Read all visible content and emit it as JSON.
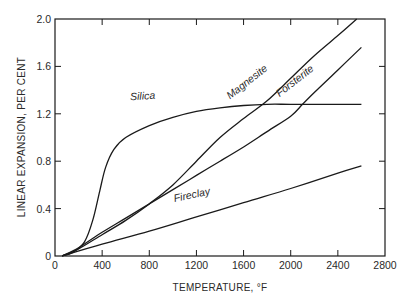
{
  "chart_data": {
    "type": "line",
    "title": "",
    "xlabel": "TEMPERATURE, °F",
    "ylabel": "LINEAR EXPANSION, PER CENT",
    "xlim": [
      0,
      2800
    ],
    "ylim": [
      0,
      2.0
    ],
    "x_ticks": [
      0,
      400,
      800,
      1200,
      1600,
      2000,
      2400,
      2800
    ],
    "x_tick_labels": [
      "0",
      "400",
      "800",
      "1200",
      "1600",
      "2000",
      "2400",
      "2800"
    ],
    "y_ticks": [
      0,
      0.4,
      0.8,
      1.2,
      1.6,
      2.0
    ],
    "y_tick_labels": [
      "0",
      "0.4",
      "0.8",
      "1.2",
      "1.6",
      "2.0"
    ],
    "grid": false,
    "legend": "inline labels on curves",
    "line_color": "#1a1a1a",
    "series": [
      {
        "name": "Silica",
        "label_pos": [
          640,
          1.29
        ],
        "label_angle": -3,
        "points": [
          [
            60,
            0
          ],
          [
            150,
            0.03
          ],
          [
            250,
            0.12
          ],
          [
            320,
            0.3
          ],
          [
            380,
            0.55
          ],
          [
            430,
            0.75
          ],
          [
            500,
            0.9
          ],
          [
            600,
            1.0
          ],
          [
            800,
            1.1
          ],
          [
            1000,
            1.17
          ],
          [
            1200,
            1.22
          ],
          [
            1400,
            1.25
          ],
          [
            1600,
            1.27
          ],
          [
            1800,
            1.28
          ],
          [
            2000,
            1.28
          ],
          [
            2300,
            1.28
          ],
          [
            2600,
            1.28
          ]
        ]
      },
      {
        "name": "Magnesite",
        "label_pos": [
          1500,
          1.3
        ],
        "label_angle": -38,
        "points": [
          [
            60,
            0
          ],
          [
            200,
            0.06
          ],
          [
            400,
            0.18
          ],
          [
            600,
            0.3
          ],
          [
            800,
            0.44
          ],
          [
            1000,
            0.6
          ],
          [
            1200,
            0.8
          ],
          [
            1400,
            1.0
          ],
          [
            1600,
            1.16
          ],
          [
            1800,
            1.31
          ],
          [
            2000,
            1.5
          ],
          [
            2200,
            1.69
          ],
          [
            2400,
            1.86
          ],
          [
            2560,
            2.0
          ]
        ]
      },
      {
        "name": "Forsterite",
        "label_pos": [
          1920,
          1.32
        ],
        "label_angle": -38,
        "points": [
          [
            60,
            0
          ],
          [
            200,
            0.07
          ],
          [
            400,
            0.2
          ],
          [
            600,
            0.32
          ],
          [
            800,
            0.44
          ],
          [
            1000,
            0.56
          ],
          [
            1200,
            0.68
          ],
          [
            1400,
            0.8
          ],
          [
            1600,
            0.92
          ],
          [
            1800,
            1.05
          ],
          [
            2000,
            1.18
          ],
          [
            2100,
            1.28
          ],
          [
            2200,
            1.38
          ],
          [
            2400,
            1.57
          ],
          [
            2600,
            1.76
          ]
        ]
      },
      {
        "name": "Fireclay",
        "label_pos": [
          1020,
          0.43
        ],
        "label_angle": -12,
        "points": [
          [
            60,
            0
          ],
          [
            400,
            0.1
          ],
          [
            800,
            0.21
          ],
          [
            1200,
            0.33
          ],
          [
            1600,
            0.45
          ],
          [
            2000,
            0.57
          ],
          [
            2400,
            0.7
          ],
          [
            2600,
            0.76
          ]
        ]
      }
    ]
  }
}
